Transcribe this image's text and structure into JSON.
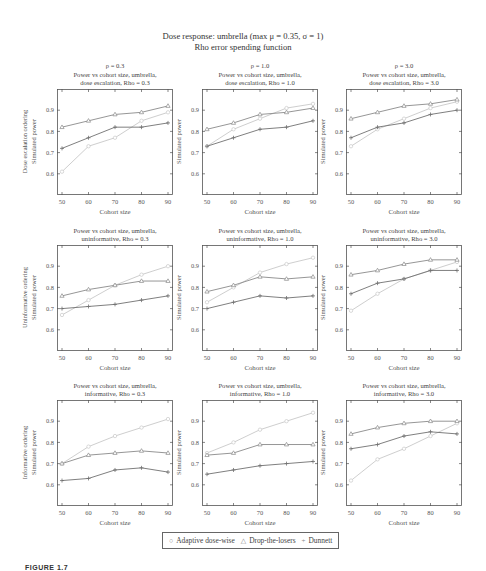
{
  "figure": {
    "title_line1": "Dose response: umbrella (max μ = 0.35, σ = 1)",
    "title_line2": "Rho error spending function",
    "caption": "FIGURE 1.7",
    "row_labels": [
      "Dose escalation ordering",
      "Uninformative ordering",
      "Informative ordering"
    ],
    "column_headers": [
      "ρ = 0.3",
      "ρ = 1.0",
      "ρ = 3.0"
    ],
    "ylabel": "Simulated power",
    "xlabel": "Cohort size",
    "legend": [
      {
        "symbol": "○",
        "label": "Adaptive dose-wise"
      },
      {
        "symbol": "△",
        "label": "Drop-the-losers"
      },
      {
        "symbol": "+",
        "label": "Dunnett"
      }
    ]
  },
  "colors": {
    "adaptive": "#c8c8c8",
    "drop_the_losers": "#8a8a8a",
    "dunnett": "#707070",
    "axis": "#555555"
  },
  "chart_data": [
    {
      "type": "line",
      "row": 0,
      "col": 0,
      "title": "Power vs cohort size, umbrella,",
      "subtitle": "dose escalation, Rho = 0.3",
      "xlabel": "Cohort size",
      "ylabel": "Simulated power",
      "x": [
        50,
        60,
        70,
        80,
        90
      ],
      "ylim": [
        0.5,
        1.0
      ],
      "yticks": [
        0.6,
        0.7,
        0.8,
        0.9
      ],
      "series": [
        {
          "name": "Adaptive dose-wise",
          "marker": "circle",
          "values": [
            0.61,
            0.73,
            0.77,
            0.85,
            0.89
          ]
        },
        {
          "name": "Drop-the-losers",
          "marker": "triangle",
          "values": [
            0.82,
            0.85,
            0.88,
            0.89,
            0.92
          ]
        },
        {
          "name": "Dunnett",
          "marker": "plus",
          "values": [
            0.72,
            0.77,
            0.82,
            0.82,
            0.84
          ]
        }
      ]
    },
    {
      "type": "line",
      "row": 0,
      "col": 1,
      "title": "Power vs cohort size, umbrella,",
      "subtitle": "dose escalation, Rho = 1.0",
      "xlabel": "Cohort size",
      "ylabel": "Simulated power",
      "x": [
        50,
        60,
        70,
        80,
        90
      ],
      "ylim": [
        0.5,
        1.0
      ],
      "yticks": [
        0.6,
        0.7,
        0.8,
        0.9
      ],
      "series": [
        {
          "name": "Adaptive dose-wise",
          "marker": "circle",
          "values": [
            0.73,
            0.81,
            0.86,
            0.91,
            0.93
          ]
        },
        {
          "name": "Drop-the-losers",
          "marker": "triangle",
          "values": [
            0.81,
            0.84,
            0.88,
            0.89,
            0.91
          ]
        },
        {
          "name": "Dunnett",
          "marker": "plus",
          "values": [
            0.73,
            0.77,
            0.81,
            0.82,
            0.85
          ]
        }
      ]
    },
    {
      "type": "line",
      "row": 0,
      "col": 2,
      "title": "Power vs cohort size, umbrella,",
      "subtitle": "dose escalation, Rho = 3.0",
      "xlabel": "Cohort size",
      "ylabel": "Simulated power",
      "x": [
        50,
        60,
        70,
        80,
        90
      ],
      "ylim": [
        0.5,
        1.0
      ],
      "yticks": [
        0.6,
        0.7,
        0.8,
        0.9
      ],
      "series": [
        {
          "name": "Adaptive dose-wise",
          "marker": "circle",
          "values": [
            0.73,
            0.81,
            0.86,
            0.91,
            0.94
          ]
        },
        {
          "name": "Drop-the-losers",
          "marker": "triangle",
          "values": [
            0.86,
            0.89,
            0.92,
            0.93,
            0.95
          ]
        },
        {
          "name": "Dunnett",
          "marker": "plus",
          "values": [
            0.77,
            0.82,
            0.84,
            0.88,
            0.9
          ]
        }
      ]
    },
    {
      "type": "line",
      "row": 1,
      "col": 0,
      "title": "Power vs cohort size, umbrella,",
      "subtitle": "uninformative, Rho = 0.3",
      "xlabel": "Cohort size",
      "ylabel": "Simulated power",
      "x": [
        50,
        60,
        70,
        80,
        90
      ],
      "ylim": [
        0.5,
        1.0
      ],
      "yticks": [
        0.6,
        0.7,
        0.8,
        0.9
      ],
      "series": [
        {
          "name": "Adaptive dose-wise",
          "marker": "circle",
          "values": [
            0.67,
            0.74,
            0.81,
            0.86,
            0.9
          ]
        },
        {
          "name": "Drop-the-losers",
          "marker": "triangle",
          "values": [
            0.76,
            0.79,
            0.81,
            0.83,
            0.83
          ]
        },
        {
          "name": "Dunnett",
          "marker": "plus",
          "values": [
            0.7,
            0.71,
            0.72,
            0.74,
            0.76
          ]
        }
      ]
    },
    {
      "type": "line",
      "row": 1,
      "col": 1,
      "title": "Power vs cohort size, umbrella,",
      "subtitle": "uninformative, Rho = 1.0",
      "xlabel": "Cohort size",
      "ylabel": "Simulated power",
      "x": [
        50,
        60,
        70,
        80,
        90
      ],
      "ylim": [
        0.5,
        1.0
      ],
      "yticks": [
        0.6,
        0.7,
        0.8,
        0.9
      ],
      "series": [
        {
          "name": "Adaptive dose-wise",
          "marker": "circle",
          "values": [
            0.73,
            0.8,
            0.87,
            0.91,
            0.94
          ]
        },
        {
          "name": "Drop-the-losers",
          "marker": "triangle",
          "values": [
            0.78,
            0.81,
            0.85,
            0.84,
            0.85
          ]
        },
        {
          "name": "Dunnett",
          "marker": "plus",
          "values": [
            0.7,
            0.73,
            0.76,
            0.75,
            0.76
          ]
        }
      ]
    },
    {
      "type": "line",
      "row": 1,
      "col": 2,
      "title": "Power vs cohort size, umbrella,",
      "subtitle": "uninformative, Rho = 3.0",
      "xlabel": "Cohort size",
      "ylabel": "Simulated power",
      "x": [
        50,
        60,
        70,
        80,
        90
      ],
      "ylim": [
        0.5,
        1.0
      ],
      "yticks": [
        0.6,
        0.7,
        0.8,
        0.9
      ],
      "series": [
        {
          "name": "Adaptive dose-wise",
          "marker": "circle",
          "values": [
            0.69,
            0.77,
            0.84,
            0.88,
            0.92
          ]
        },
        {
          "name": "Drop-the-losers",
          "marker": "triangle",
          "values": [
            0.86,
            0.88,
            0.91,
            0.93,
            0.93
          ]
        },
        {
          "name": "Dunnett",
          "marker": "plus",
          "values": [
            0.77,
            0.82,
            0.84,
            0.88,
            0.88
          ]
        }
      ]
    },
    {
      "type": "line",
      "row": 2,
      "col": 0,
      "title": "Power vs cohort size, umbrella,",
      "subtitle": "informative, Rho = 0.3",
      "xlabel": "Cohort size",
      "ylabel": "Simulated power",
      "x": [
        50,
        60,
        70,
        80,
        90
      ],
      "ylim": [
        0.5,
        1.0
      ],
      "yticks": [
        0.6,
        0.7,
        0.8,
        0.9
      ],
      "series": [
        {
          "name": "Adaptive dose-wise",
          "marker": "circle",
          "values": [
            0.7,
            0.78,
            0.83,
            0.87,
            0.91
          ]
        },
        {
          "name": "Drop-the-losers",
          "marker": "triangle",
          "values": [
            0.7,
            0.74,
            0.75,
            0.76,
            0.75
          ]
        },
        {
          "name": "Dunnett",
          "marker": "plus",
          "values": [
            0.62,
            0.63,
            0.67,
            0.68,
            0.66
          ]
        }
      ]
    },
    {
      "type": "line",
      "row": 2,
      "col": 1,
      "title": "Power vs cohort size, umbrella,",
      "subtitle": "informative, Rho = 1.0",
      "xlabel": "Cohort size",
      "ylabel": "Simulated power",
      "x": [
        50,
        60,
        70,
        80,
        90
      ],
      "ylim": [
        0.5,
        1.0
      ],
      "yticks": [
        0.6,
        0.7,
        0.8,
        0.9
      ],
      "series": [
        {
          "name": "Adaptive dose-wise",
          "marker": "circle",
          "values": [
            0.75,
            0.8,
            0.86,
            0.9,
            0.94
          ]
        },
        {
          "name": "Drop-the-losers",
          "marker": "triangle",
          "values": [
            0.74,
            0.75,
            0.79,
            0.79,
            0.79
          ]
        },
        {
          "name": "Dunnett",
          "marker": "plus",
          "values": [
            0.65,
            0.67,
            0.69,
            0.7,
            0.71
          ]
        }
      ]
    },
    {
      "type": "line",
      "row": 2,
      "col": 2,
      "title": "Power vs cohort size, umbrella,",
      "subtitle": "informative, Rho = 3.0",
      "xlabel": "Cohort size",
      "ylabel": "Simulated power",
      "x": [
        50,
        60,
        70,
        80,
        90
      ],
      "ylim": [
        0.5,
        1.0
      ],
      "yticks": [
        0.6,
        0.7,
        0.8,
        0.9
      ],
      "series": [
        {
          "name": "Adaptive dose-wise",
          "marker": "circle",
          "values": [
            0.62,
            0.72,
            0.77,
            0.83,
            0.89
          ]
        },
        {
          "name": "Drop-the-losers",
          "marker": "triangle",
          "values": [
            0.84,
            0.87,
            0.89,
            0.9,
            0.9
          ]
        },
        {
          "name": "Dunnett",
          "marker": "plus",
          "values": [
            0.77,
            0.79,
            0.83,
            0.85,
            0.84
          ]
        }
      ]
    }
  ]
}
